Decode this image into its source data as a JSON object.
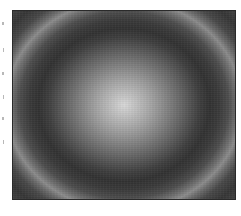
{
  "image": {
    "subject": "concentric ring interference pattern",
    "palette": "grayscale",
    "center_color": "#d8d8d8",
    "dark_ring_color": "#323232",
    "mid_ring_color": "#8c8c8c",
    "frame_color": "#2a2a2a",
    "background_color": "#ffffff"
  },
  "axis": {
    "left_ticks_count": 6
  }
}
